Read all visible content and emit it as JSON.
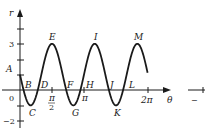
{
  "chart_data": {
    "type": "line",
    "title": "",
    "function": "r = 1 - 2 sin 3θ",
    "xlabel": "θ",
    "ylabel": "r",
    "xlim": [
      0,
      6.2832
    ],
    "ylim": [
      -2,
      4
    ],
    "grid": false,
    "x_ticks": [
      {
        "value": 1.5708,
        "label": "π/2"
      },
      {
        "value": 3.1416,
        "label": "π"
      },
      {
        "value": 6.2832,
        "label": "2π"
      }
    ],
    "y_ticks": [
      {
        "value": 3,
        "label": "3"
      },
      {
        "value": 0,
        "label": "0"
      },
      {
        "value": -2,
        "label": "−2"
      }
    ],
    "series": [
      {
        "name": "r(θ)",
        "x": [
          0,
          0.1745,
          0.5236,
          1.0472,
          1.5708,
          2.0944,
          2.618,
          3.1416,
          3.6652,
          4.1888,
          4.7124,
          5.236,
          5.7596,
          6.2832
        ],
        "values": [
          1,
          0,
          -1,
          1,
          3,
          1,
          -1,
          1,
          3,
          1,
          -1,
          1,
          3,
          1
        ]
      }
    ],
    "annotations": [
      {
        "label": "A",
        "x": 0,
        "y": 1
      },
      {
        "label": "B",
        "x": 0.1745,
        "y": 0
      },
      {
        "label": "C",
        "x": 0.5236,
        "y": -1
      },
      {
        "label": "D",
        "x": 0.8727,
        "y": 0
      },
      {
        "label": "E",
        "x": 1.5708,
        "y": 3
      },
      {
        "label": "F",
        "x": 2.2689,
        "y": 0
      },
      {
        "label": "G",
        "x": 2.618,
        "y": -1
      },
      {
        "label": "H",
        "x": 2.9671,
        "y": 0
      },
      {
        "label": "I",
        "x": 3.6652,
        "y": 3
      },
      {
        "label": "J",
        "x": 4.3633,
        "y": 0
      },
      {
        "label": "K",
        "x": 4.7124,
        "y": -1
      },
      {
        "label": "L",
        "x": 5.0615,
        "y": 0
      },
      {
        "label": "M",
        "x": 5.7596,
        "y": 3
      }
    ]
  },
  "labels": {
    "r_axis": "r",
    "theta_axis": "θ",
    "tick_3": "3",
    "tick_0": "0",
    "tick_neg2": "−2",
    "tick_pi2_num": "π",
    "tick_pi2_den": "2",
    "tick_pi": "π",
    "tick_2pi": "2π",
    "right_fragment": "−",
    "A": "A",
    "B": "B",
    "C": "C",
    "D": "D",
    "E": "E",
    "F": "F",
    "G": "G",
    "H": "H",
    "I": "I",
    "J": "J",
    "K": "K",
    "L": "L",
    "M": "M"
  }
}
